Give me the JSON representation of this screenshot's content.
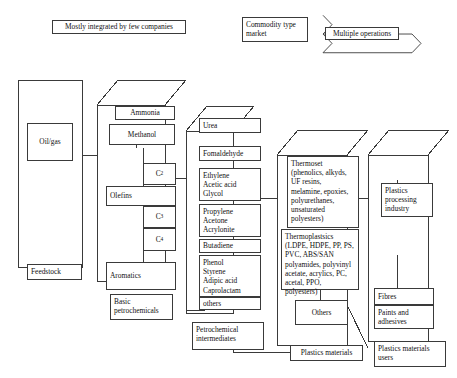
{
  "diagram": {
    "stroke_color": "#3a3a3a",
    "background_color": "#ffffff"
  },
  "top_labels": {
    "integration_note": "Mostly integrated by few companies",
    "market_note": "Commodity type\nmarket",
    "arrow_label": "Multiple operations"
  },
  "stage_labels": {
    "feedstock": "Feedstock",
    "basic_petrochemicals": "Basic\npetrochemicals",
    "petrochemical_intermediates": "Petrochemical\nintermediates",
    "plastics_materials": "Plastics materials",
    "plastics_materials_users": "Plastics materials\nusers"
  },
  "feedstock_group": {
    "items": [
      {
        "label": "Oil/gas"
      }
    ]
  },
  "basic_group": {
    "items": [
      {
        "label": "Ammonia"
      },
      {
        "label": "Methanol"
      },
      {
        "label": "C2",
        "text": "C",
        "subscript": "2"
      },
      {
        "label": "Olefins"
      },
      {
        "label": "C3",
        "text": "C",
        "subscript": "3"
      },
      {
        "label": "C4",
        "text": "C",
        "subscript": "4"
      },
      {
        "label": "Aromatics"
      }
    ]
  },
  "intermediates_group": {
    "items": [
      {
        "label": "Urea"
      },
      {
        "label": "Fomaldehyde"
      },
      {
        "label": "Ethylene\nAcetic acid\nGlycol"
      },
      {
        "label": "Propylene\nAcetone\nAcrylonite"
      },
      {
        "label": "Butadiene"
      },
      {
        "label": "Phenol\nStyrene\nAdipic acid\nCaprolactam"
      },
      {
        "label": "others"
      }
    ]
  },
  "materials_group": {
    "items": [
      {
        "label": "Thermoset\n(phenolics, alkyds,\nUF resins,\nmelamine, epoxies,\npolyurethanes,\nunsaturated\npolyesters)"
      },
      {
        "label": "Thermoplastsics\n(LDPE, HDPE, PP, PS,\nPVC, ABS/SAN\npolyamides, polyvinyl\nacetate, acrylics, PC,\nacetal, PPO, polyesters)"
      },
      {
        "label": "Others"
      }
    ]
  },
  "users_group": {
    "items": [
      {
        "label": "Plastics\nprocessing\nindustry"
      },
      {
        "label": "Fibres"
      },
      {
        "label": "Paints and\nadhesives"
      }
    ]
  }
}
